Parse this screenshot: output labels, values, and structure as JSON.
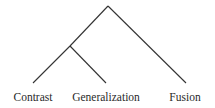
{
  "diagram": {
    "type": "tree",
    "root": {
      "x": 108,
      "y": 6
    },
    "internal_node": {
      "x": 70,
      "y": 46
    },
    "leaves": [
      {
        "label": "Contrast",
        "x": 33,
        "y": 83,
        "label_x": 33
      },
      {
        "label": "Generalization",
        "x": 106,
        "y": 83,
        "label_x": 106
      },
      {
        "label": "Fusion",
        "x": 186,
        "y": 83,
        "label_x": 185
      }
    ],
    "edges": [
      {
        "from": "root",
        "to": "internal_node"
      },
      {
        "from": "internal_node",
        "to": "Contrast"
      },
      {
        "from": "internal_node",
        "to": "Generalization"
      },
      {
        "from": "root",
        "to": "Fusion"
      }
    ],
    "line_color": "#333333"
  }
}
